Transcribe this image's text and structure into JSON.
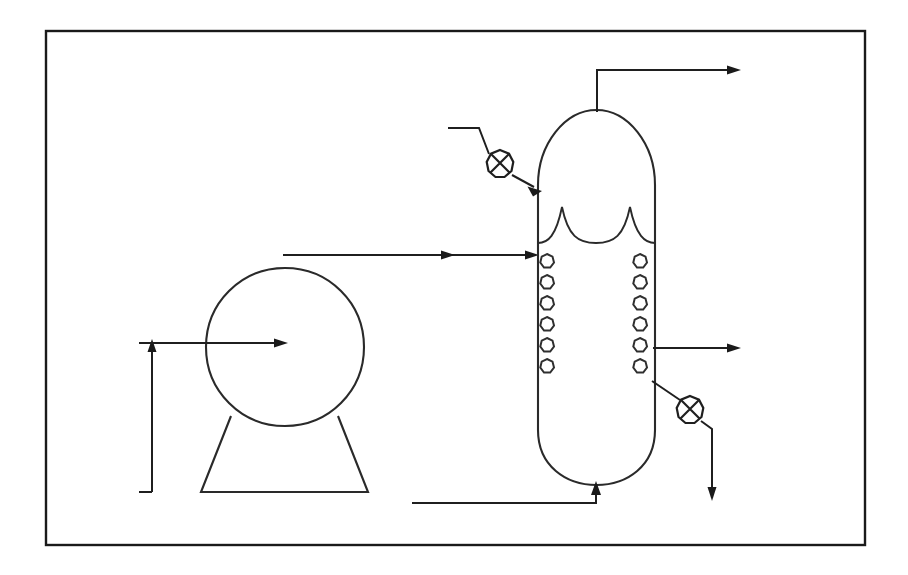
{
  "diagram": {
    "kind": "p-and-id",
    "background_color": "#ffffff",
    "line_color": "#1a1a1a",
    "frame": {
      "label": "diagram-border",
      "x": 46,
      "y": 31,
      "width": 819,
      "height": 514,
      "stroke_width": 2.4
    },
    "equipment": [
      {
        "id": "horizontal-drum",
        "label": "Horizontal Drum / Separator",
        "shape": "circle",
        "cx": 285,
        "cy": 347,
        "r": 79,
        "support": {
          "label": "saddle-support",
          "shape": "trapezoid",
          "top_left_x": 231,
          "top_right_x": 338,
          "top_y": 416,
          "bottom_left_x": 201,
          "bottom_right_x": 368,
          "bottom_y": 492
        }
      },
      {
        "id": "vertical-column",
        "label": "Vertical Column / Absorber",
        "shape": "vessel-with-domed-heads",
        "left_x": 538,
        "right_x": 655,
        "top_y": 110,
        "bottom_y": 485,
        "head_radius": 58,
        "demister": {
          "label": "demister-pads",
          "peaks": 2,
          "y_base": 243,
          "y_peak": 205
        },
        "packing": {
          "label": "packing-rings",
          "columns": 2,
          "rings_per_column": 6,
          "left_column_cx": 547,
          "right_column_cx": 640,
          "first_cy": 261,
          "spacing": 21,
          "ring_radius": 7.5
        }
      }
    ],
    "valves": [
      {
        "id": "top-inlet-valve",
        "label": "top-feed-valve",
        "type": "cross-circle-valve",
        "cx": 500,
        "cy": 164,
        "r": 14
      },
      {
        "id": "bottom-outlet-valve",
        "label": "bottoms-draw-valve",
        "type": "cross-circle-valve",
        "cx": 690,
        "cy": 410,
        "r": 14
      }
    ],
    "streams": [
      {
        "id": "overhead-vapor-out",
        "label": "overhead-vapour-outlet",
        "direction": "right",
        "points": "597,110 597,70 740,70",
        "arrow_at": "740,70"
      },
      {
        "id": "top-feed-in",
        "label": "top-feed-inlet",
        "direction": "down-right",
        "points": "448,128 478,128 538,188",
        "arrow_at": "538,188"
      },
      {
        "id": "mid-feed-in",
        "label": "mid-feed-inlet-from-drum",
        "direction": "right",
        "points": "285,255 538,255",
        "arrow_at": "538,255"
      },
      {
        "id": "side-draw-out",
        "label": "side-draw-outlet",
        "direction": "right",
        "points": "655,348 740,348",
        "arrow_at": "740,348"
      },
      {
        "id": "bottoms-out",
        "label": "bottoms-product-outlet",
        "direction": "down",
        "points": "655,382 710,438 710,500",
        "arrow_at": "710,500"
      },
      {
        "id": "column-bottom-in",
        "label": "column-bottom-inlet",
        "direction": "up",
        "points": "412,503 596,503 596,485",
        "arrow_at": "596,485"
      },
      {
        "id": "drum-inlet",
        "label": "drum-centre-inlet",
        "direction": "right",
        "points": "152,345 285,345",
        "arrow_at": "285,345"
      },
      {
        "id": "drum-recycle",
        "label": "drum-recycle-riser",
        "direction": "up",
        "points": "152,492 152,345",
        "arrow_at": "152,345"
      }
    ]
  }
}
